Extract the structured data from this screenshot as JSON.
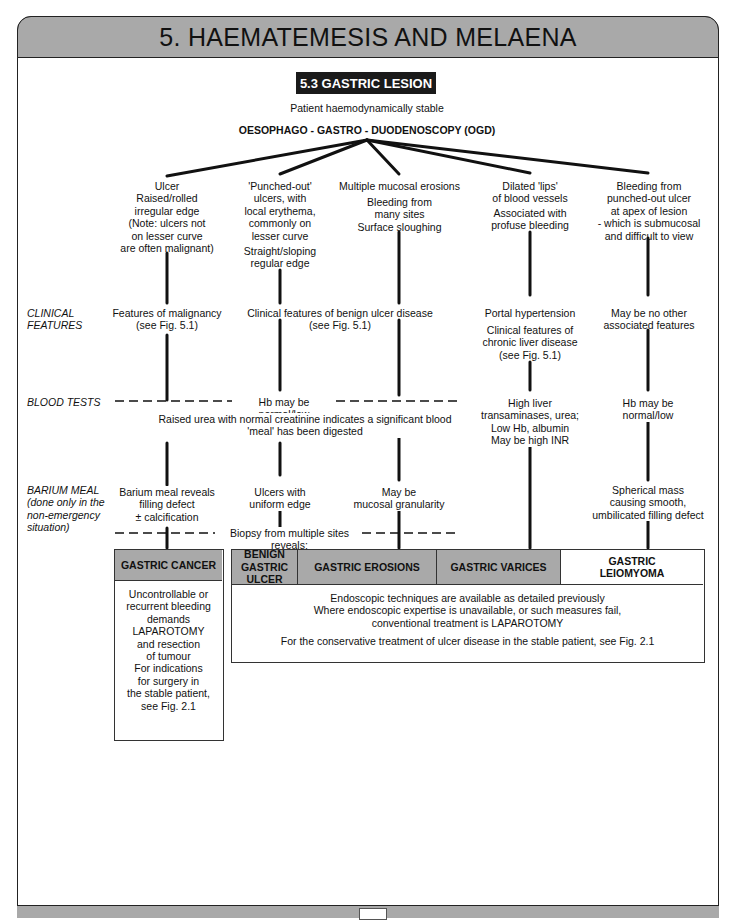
{
  "header": {
    "title": "5. HAEMATEMESIS AND MELAENA"
  },
  "section": {
    "badge": "5.3 GASTRIC LESION",
    "condition": "Patient haemodynamically stable",
    "procedure": "OESOPHAGO - GASTRO - DUODENOSCOPY (OGD)"
  },
  "row_labels": {
    "clinical": "CLINICAL\nFEATURES",
    "blood": "BLOOD TESTS",
    "barium": "BARIUM MEAL\n(done only in the\nnon-emergency\nsituation)"
  },
  "findings": [
    {
      "title": "Ulcer\nRaised/rolled\nirregular edge\n(Note: ulcers not\non lesser curve\nare often malignant)"
    },
    {
      "title": "'Punched-out'\nulcers, with\nlocal erythema,\ncommonly on\nlesser curve",
      "extra": "Straight/sloping\nregular edge"
    },
    {
      "title": "Multiple mucosal erosions",
      "extra": "Bleeding from\nmany sites\nSurface sloughing"
    },
    {
      "title": "Dilated 'lips'\nof blood vessels",
      "extra": "Associated with\nprofuse bleeding"
    },
    {
      "title": "Bleeding from\npunched-out ulcer\nat apex of lesion\n- which is submucosal\nand difficult to view"
    }
  ],
  "clinical": {
    "cancer": "Features of malignancy\n(see Fig. 5.1)",
    "benign": "Clinical features of benign ulcer disease\n(see Fig. 5.1)",
    "varices_1": "Portal hypertension",
    "varices_2": "Clinical features of\nchronic liver disease\n(see Fig. 5.1)",
    "leiomyoma": "May be no other\nassociated features"
  },
  "blood": {
    "shared_hb": "Hb may be normal/low",
    "shared_urea": "Raised urea with normal creatinine indicates a significant blood\n'meal' has been digested",
    "varices": "High liver\ntransaminases, urea;\nLow Hb, albumin\nMay be high INR",
    "leiomyoma": "Hb may be\nnormal/low"
  },
  "barium": {
    "cancer": "Barium meal reveals\nfilling defect\n± calcification",
    "benign": "Ulcers with\nuniform edge",
    "erosions": "May be\nmucosal granularity",
    "leiomyoma": "Spherical mass\ncausing smooth,\numbilicated filling defect"
  },
  "biopsy": "Biopsy from multiple sites reveals:",
  "diagnoses": {
    "cancer": "GASTRIC CANCER",
    "benign": "BENIGN\nGASTRIC ULCER",
    "erosions": "GASTRIC EROSIONS",
    "varices": "GASTRIC VARICES",
    "leiomyoma": "GASTRIC\nLEIOMYOMA"
  },
  "management": {
    "cancer": "Uncontrollable or\nrecurrent bleeding\ndemands\nLAPAROTOMY\nand resection\nof tumour\nFor indications\nfor surgery in\nthe stable patient,\nsee Fig. 2.1",
    "shared_main": "Endoscopic techniques are available as detailed previously\nWhere endoscopic expertise is unavailable, or such measures fail,\nconventional treatment is LAPAROTOMY",
    "shared_note": "For the conservative treatment of ulcer disease in the stable patient, see Fig. 2.1"
  }
}
